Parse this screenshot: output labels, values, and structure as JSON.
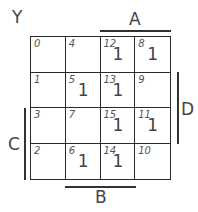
{
  "map": {
    "title": "Y",
    "variables": {
      "A": "A",
      "B": "B",
      "C": "C",
      "D": "D"
    },
    "rows": [
      [
        {
          "index": "0",
          "value": ""
        },
        {
          "index": "4",
          "value": ""
        },
        {
          "index": "12",
          "value": "1"
        },
        {
          "index": "8",
          "value": "1"
        }
      ],
      [
        {
          "index": "1",
          "value": ""
        },
        {
          "index": "5",
          "value": "1"
        },
        {
          "index": "13",
          "value": "1"
        },
        {
          "index": "9",
          "value": ""
        }
      ],
      [
        {
          "index": "3",
          "value": ""
        },
        {
          "index": "7",
          "value": ""
        },
        {
          "index": "15",
          "value": "1"
        },
        {
          "index": "11",
          "value": "1"
        }
      ],
      [
        {
          "index": "2",
          "value": ""
        },
        {
          "index": "6",
          "value": "1"
        },
        {
          "index": "14",
          "value": "1"
        },
        {
          "index": "10",
          "value": ""
        }
      ]
    ]
  }
}
